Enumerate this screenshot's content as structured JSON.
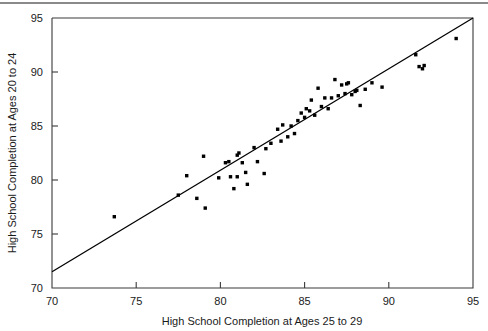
{
  "figure": {
    "separator_name": "top-horizontal-rule"
  },
  "chart_data": {
    "type": "scatter",
    "title": "",
    "subtitle": "",
    "xlabel": "High School Completion at Ages 25 to 29",
    "ylabel": "High School Completion at Ages 20 to 24",
    "xlim": [
      70,
      95
    ],
    "ylim": [
      70,
      95
    ],
    "xticks": [
      70,
      75,
      80,
      85,
      90,
      95
    ],
    "yticks": [
      70,
      75,
      80,
      85,
      90,
      95
    ],
    "xtick_labels": [
      "70",
      "75",
      "80",
      "85",
      "90",
      "95"
    ],
    "ytick_labels": [
      "70",
      "75",
      "80",
      "85",
      "90",
      "95"
    ],
    "grid": false,
    "legend": false,
    "legend_position": "none",
    "marker": "square",
    "marker_color": "#000000",
    "marker_size": 3.4,
    "points": [
      {
        "x": 73.7,
        "y": 76.6
      },
      {
        "x": 77.5,
        "y": 78.6
      },
      {
        "x": 78.0,
        "y": 80.4
      },
      {
        "x": 78.6,
        "y": 78.3
      },
      {
        "x": 79.0,
        "y": 82.2
      },
      {
        "x": 79.1,
        "y": 77.4
      },
      {
        "x": 79.9,
        "y": 80.2
      },
      {
        "x": 80.3,
        "y": 81.6
      },
      {
        "x": 80.5,
        "y": 81.7
      },
      {
        "x": 80.6,
        "y": 80.3
      },
      {
        "x": 80.8,
        "y": 79.2
      },
      {
        "x": 81.0,
        "y": 80.3
      },
      {
        "x": 81.0,
        "y": 82.3
      },
      {
        "x": 81.1,
        "y": 82.5
      },
      {
        "x": 81.3,
        "y": 81.6
      },
      {
        "x": 81.5,
        "y": 80.7
      },
      {
        "x": 81.6,
        "y": 79.6
      },
      {
        "x": 82.0,
        "y": 83.0
      },
      {
        "x": 82.2,
        "y": 81.7
      },
      {
        "x": 82.6,
        "y": 80.6
      },
      {
        "x": 82.7,
        "y": 82.9
      },
      {
        "x": 83.0,
        "y": 83.4
      },
      {
        "x": 83.4,
        "y": 84.7
      },
      {
        "x": 83.6,
        "y": 83.6
      },
      {
        "x": 83.7,
        "y": 85.1
      },
      {
        "x": 84.0,
        "y": 84.0
      },
      {
        "x": 84.2,
        "y": 85.0
      },
      {
        "x": 84.4,
        "y": 84.3
      },
      {
        "x": 84.6,
        "y": 85.5
      },
      {
        "x": 84.8,
        "y": 86.2
      },
      {
        "x": 85.0,
        "y": 85.8
      },
      {
        "x": 85.1,
        "y": 86.6
      },
      {
        "x": 85.3,
        "y": 86.4
      },
      {
        "x": 85.4,
        "y": 87.4
      },
      {
        "x": 85.6,
        "y": 86.0
      },
      {
        "x": 85.8,
        "y": 88.5
      },
      {
        "x": 86.0,
        "y": 86.8
      },
      {
        "x": 86.2,
        "y": 87.6
      },
      {
        "x": 86.4,
        "y": 86.6
      },
      {
        "x": 86.6,
        "y": 87.6
      },
      {
        "x": 86.8,
        "y": 89.3
      },
      {
        "x": 87.0,
        "y": 87.8
      },
      {
        "x": 87.2,
        "y": 88.8
      },
      {
        "x": 87.4,
        "y": 88.0
      },
      {
        "x": 87.5,
        "y": 88.9
      },
      {
        "x": 87.6,
        "y": 89.0
      },
      {
        "x": 87.8,
        "y": 87.9
      },
      {
        "x": 88.0,
        "y": 88.2
      },
      {
        "x": 88.1,
        "y": 88.3
      },
      {
        "x": 88.3,
        "y": 86.9
      },
      {
        "x": 88.6,
        "y": 88.4
      },
      {
        "x": 89.0,
        "y": 89.0
      },
      {
        "x": 89.6,
        "y": 88.6
      },
      {
        "x": 91.6,
        "y": 91.6
      },
      {
        "x": 91.8,
        "y": 90.5
      },
      {
        "x": 92.0,
        "y": 90.3
      },
      {
        "x": 92.1,
        "y": 90.6
      },
      {
        "x": 94.0,
        "y": 93.1
      }
    ],
    "fit_line": {
      "name": "regression-line",
      "x0": 70,
      "y0": 71.5,
      "x1": 95,
      "y1": 95.0,
      "color": "#000000"
    }
  }
}
